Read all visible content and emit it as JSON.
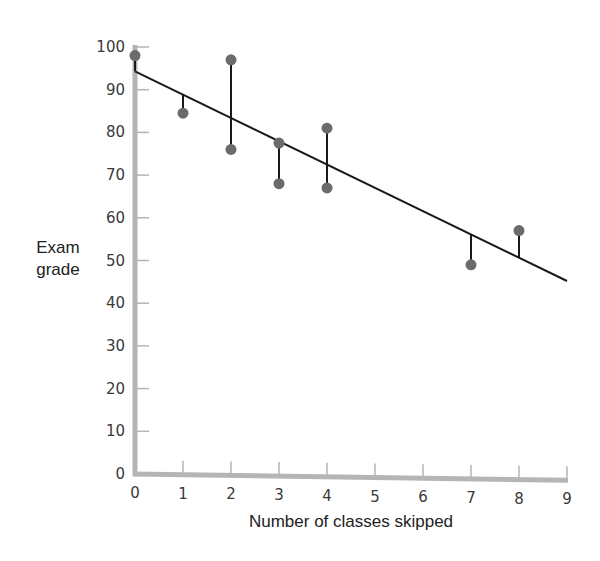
{
  "chart_data": {
    "type": "scatter",
    "title": "",
    "xlabel": "Number of classes skipped",
    "ylabel": "Exam grade",
    "ylabel_lines": [
      "Exam",
      "grade"
    ],
    "xlim": [
      0,
      9
    ],
    "ylim": [
      0,
      100
    ],
    "x_ticks": [
      0,
      1,
      2,
      3,
      4,
      5,
      6,
      7,
      8,
      9
    ],
    "y_ticks": [
      0,
      10,
      20,
      30,
      40,
      50,
      60,
      70,
      80,
      90,
      100
    ],
    "grid": false,
    "legend": null,
    "points": [
      {
        "x": 0,
        "y": 98
      },
      {
        "x": 1,
        "y": 84.5
      },
      {
        "x": 2,
        "y": 97
      },
      {
        "x": 2,
        "y": 76
      },
      {
        "x": 3,
        "y": 77.5
      },
      {
        "x": 3,
        "y": 68
      },
      {
        "x": 4,
        "y": 81
      },
      {
        "x": 4,
        "y": 67
      },
      {
        "x": 7,
        "y": 49
      },
      {
        "x": 8,
        "y": 57
      }
    ],
    "regression_line": {
      "x0": 0,
      "y0": 94.3,
      "x1": 9,
      "y1": 45.2
    },
    "residual_lines": true,
    "annotations": []
  },
  "colors": {
    "axis": "#b5b5b5",
    "point": "#6b6b6b",
    "line": "#1a1a1a"
  }
}
